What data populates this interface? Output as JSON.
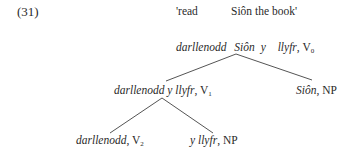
{
  "example_number": "(31)",
  "gloss": {
    "word1": "'read",
    "word2": "Siôn the book'"
  },
  "tree": {
    "root": {
      "w1": "darllenodd",
      "w2": "Siôn",
      "w3": "y",
      "w4": "llyfr",
      "sep": ",",
      "cat": "V",
      "sub": "0"
    },
    "left": {
      "words": "darllenodd y llyfr",
      "sep": ",",
      "cat": "V",
      "sub": "1"
    },
    "right": {
      "words": "Siôn",
      "sep": ",",
      "cat": "NP"
    },
    "leftleft": {
      "words": "darllenodd",
      "sep": ",",
      "cat": "V",
      "sub": "2"
    },
    "leftright": {
      "words": "y llyfr",
      "sep": ",",
      "cat": "NP"
    }
  }
}
